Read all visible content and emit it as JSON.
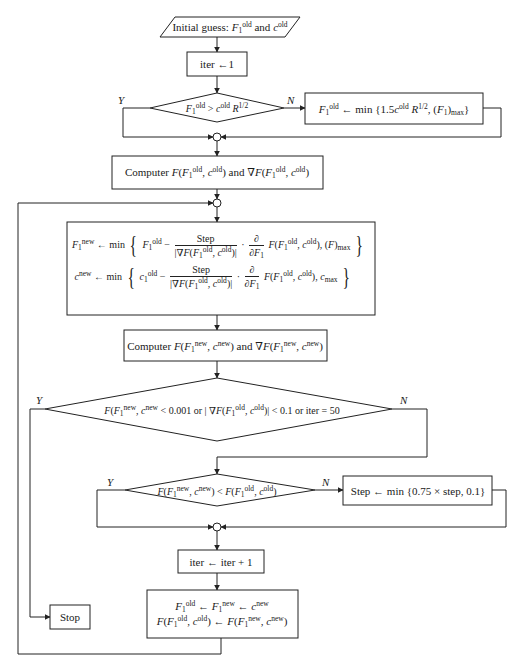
{
  "flowchart": {
    "start": {
      "text": "Initial guess: F1^old and c^old",
      "prefix": "Initial guess: ",
      "mid": " and "
    },
    "init_iter": {
      "text": "iter ← 1",
      "label": "iter ←1"
    },
    "decision1": {
      "text": "F1^old > c^old R^1/2",
      "yes": "Y",
      "no": "N"
    },
    "clamp_box": {
      "text": "F1^old ← min {1.5c^old R^1/2, (F1)max}"
    },
    "compute_old": {
      "text": "Computer F(F1^old, c^old) and ∇F(F1^old, c^old)",
      "word": "Computer",
      "and": "and"
    },
    "update_box": {
      "line1": "F1^new ← min { F1^old − Step/|∇F(F1^old, c^old)| · ∂/∂F1 F(F1^old, c^old), (F)max }",
      "line2": "c^new ← min { c1^old − Step/|∇F(F1^old, c^old)| · ∂/∂F1 F(F1^old, c^old), c_max }",
      "step": "Step",
      "min": "min"
    },
    "compute_new": {
      "text": "Computer F(F1^new, c^new) and ∇F(F1^new, c^new)",
      "word": "Computer",
      "and": "and"
    },
    "decision2": {
      "text": "F(F1^new, c^new < 0.001 or |∇F(F1^old, c^old)| < 0.1 or iter = 50",
      "yes": "Y",
      "no": "N",
      "part_or1": " < 0.001 or ",
      "part_or2": " < 0.1 or iter = 50"
    },
    "decision3": {
      "text": "F(F1^new, c^new) < F(F1^old, c^old)",
      "yes": "Y",
      "no": "N"
    },
    "step_box": {
      "text": "Step ← min {0.75 × step, 0.1}"
    },
    "iter_inc": {
      "text": "iter ← iter + 1"
    },
    "swap_box": {
      "line1": "F1^old ← F1^new ← c^new",
      "line2": "F(F1^old, c^old) ← F(F1^new, c^new)"
    },
    "stop": {
      "text": "Stop"
    }
  },
  "colors": {
    "line": "#222222",
    "background": "#ffffff",
    "text": "#1a1a1a"
  }
}
